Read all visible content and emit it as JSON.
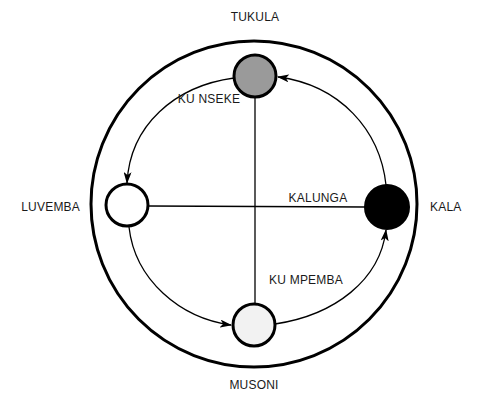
{
  "diagram": {
    "type": "cosmogram",
    "nodes": {
      "top": {
        "label": "TUKULA",
        "fill": "#9a9a9a"
      },
      "right": {
        "label": "KALA",
        "fill": "#000000"
      },
      "bottom": {
        "label": "MUSONI",
        "fill": "#f2f2f2"
      },
      "left": {
        "label": "LUVEMBA",
        "fill": "#ffffff"
      }
    },
    "lines": {
      "horizontal": {
        "label": "KALUNGA"
      }
    },
    "regions": {
      "upper": {
        "label": "KU NSEKE"
      },
      "lower": {
        "label": "KU MPEMBA"
      }
    },
    "flow": [
      "KALA",
      "TUKULA",
      "LUVEMBA",
      "MUSONI",
      "KALA"
    ],
    "colors": {
      "stroke": "#000000",
      "background": "#ffffff"
    }
  }
}
